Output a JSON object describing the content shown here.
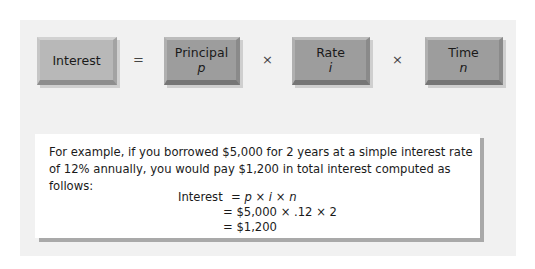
{
  "diagram": {
    "boxes": [
      {
        "label": "Interest",
        "symbol": ""
      },
      {
        "label": "Principal",
        "symbol": "p"
      },
      {
        "label": "Rate",
        "symbol": "i"
      },
      {
        "label": "Time",
        "symbol": "n"
      }
    ],
    "operators": [
      "=",
      "×",
      "×"
    ]
  },
  "example": {
    "text": "For example, if you borrowed $5,000 for 2 years at a simple interest rate of 12% annually, you would pay $1,200 in total interest computed as follows:",
    "equation": {
      "line1_label": "Interest",
      "line1": "= p × i × n",
      "line2": "= $5,000 × .12 × 2",
      "line3": "= $1,200"
    }
  },
  "colors": {
    "panel": "#f1f1f1",
    "box_light": "#b8b8b8",
    "box_dark": "#9d9d9d",
    "card": "#ffffff",
    "card_shadow": "#a9a9a9"
  }
}
